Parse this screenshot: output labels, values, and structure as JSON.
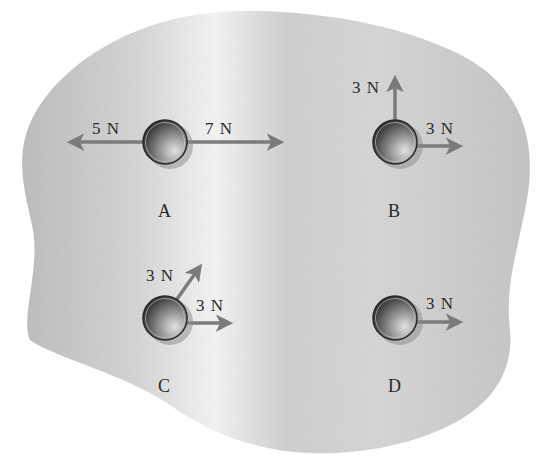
{
  "diagram": {
    "type": "free-body force diagram",
    "colors": {
      "background": "#ffffff",
      "surface_dark": "#b9b9b9",
      "surface_light": "#f4f4f4",
      "arrow": "#7b7b7b",
      "ball_dark": "#2e2e2e",
      "ball_light": "#d8d8d8",
      "text": "#2a2a2a"
    },
    "balls": [
      {
        "label": "A",
        "forces": [
          {
            "label": "5 N",
            "magnitude": 5,
            "unit": "N",
            "direction": "left"
          },
          {
            "label": "7 N",
            "magnitude": 7,
            "unit": "N",
            "direction": "right"
          }
        ]
      },
      {
        "label": "B",
        "forces": [
          {
            "label": "3 N",
            "magnitude": 3,
            "unit": "N",
            "direction": "up"
          },
          {
            "label": "3 N",
            "magnitude": 3,
            "unit": "N",
            "direction": "right"
          }
        ]
      },
      {
        "label": "C",
        "forces": [
          {
            "label": "3 N",
            "magnitude": 3,
            "unit": "N",
            "direction": "up-right (diagonal)"
          },
          {
            "label": "3 N",
            "magnitude": 3,
            "unit": "N",
            "direction": "right"
          }
        ]
      },
      {
        "label": "D",
        "forces": [
          {
            "label": "3 N",
            "magnitude": 3,
            "unit": "N",
            "direction": "right"
          }
        ]
      }
    ]
  }
}
